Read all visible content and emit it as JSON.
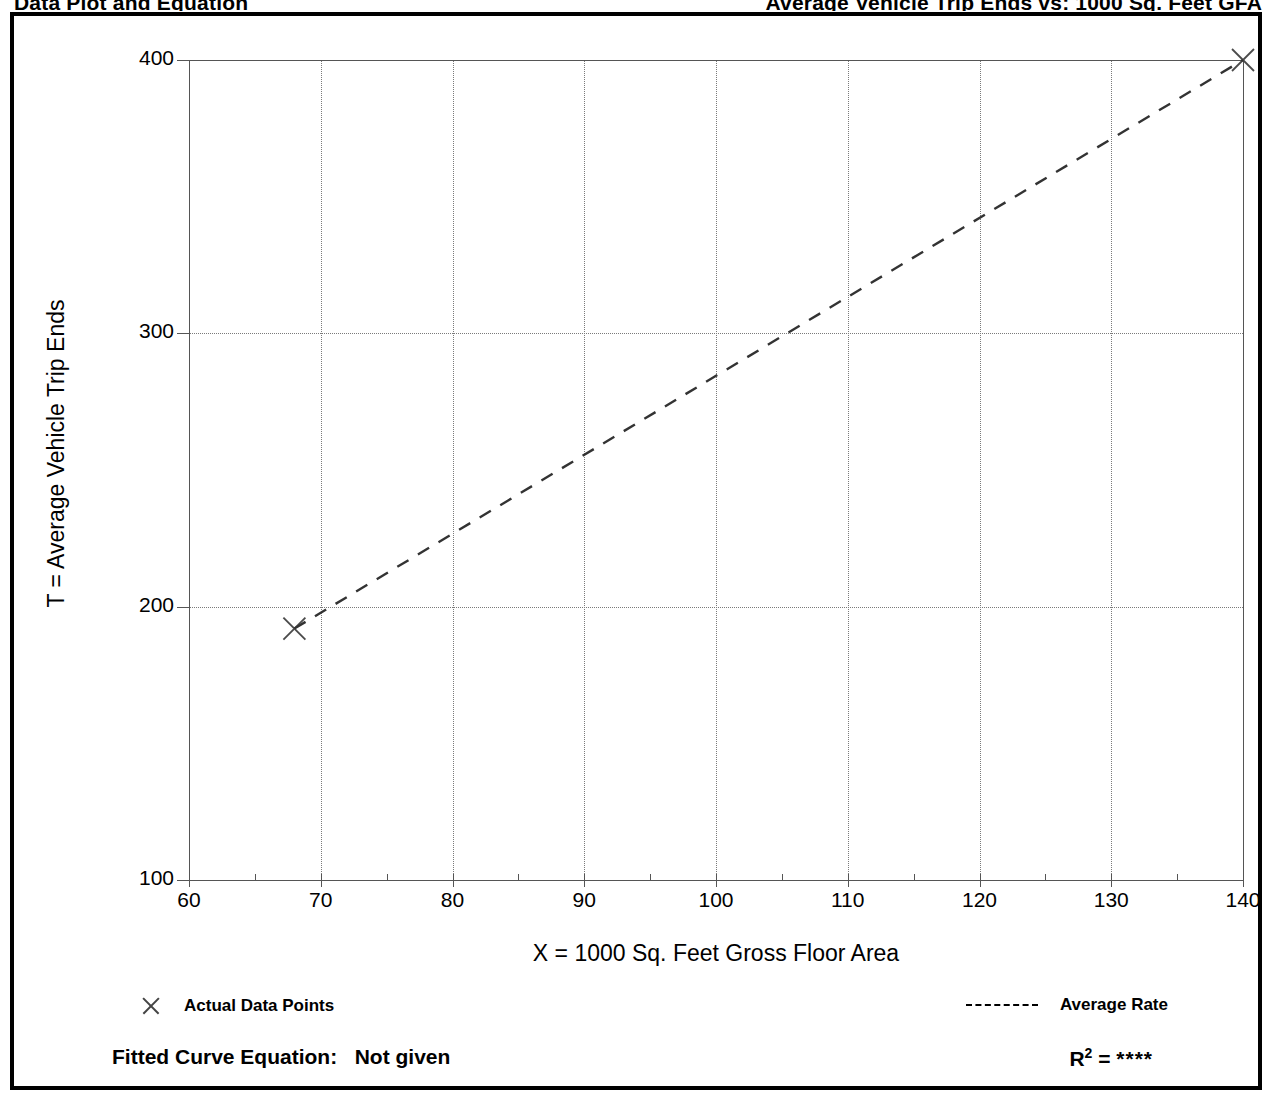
{
  "document": {
    "heading_left": "Data Plot and Equation",
    "heading_right": "Average Vehicle Trip Ends vs: 1000 Sq. Feet GFA"
  },
  "chart_data": {
    "type": "scatter",
    "title": "",
    "xlabel": "X = 1000 Sq. Feet Gross Floor Area",
    "ylabel": "T = Average Vehicle Trip Ends",
    "xlim": [
      60,
      140
    ],
    "ylim": [
      100,
      400
    ],
    "x_ticks": [
      60,
      70,
      80,
      90,
      100,
      110,
      120,
      130,
      140
    ],
    "y_ticks": [
      100,
      200,
      300,
      400
    ],
    "x_minor_step": 5,
    "grid": true,
    "grid_style": "dotted",
    "legend_position": "below-plot",
    "series": [
      {
        "name": "Actual Data Points",
        "type": "scatter",
        "marker": "x",
        "points": [
          {
            "x": 68,
            "y": 192
          },
          {
            "x": 140,
            "y": 400
          }
        ]
      },
      {
        "name": "Average Rate",
        "type": "line",
        "style": "dashed",
        "points": [
          {
            "x": 68,
            "y": 192
          },
          {
            "x": 140,
            "y": 400
          }
        ]
      }
    ],
    "annotations": {
      "fitted_curve_equation_label": "Fitted Curve Equation:",
      "fitted_curve_equation_value": "Not given",
      "r2_label": "R",
      "r2_exponent": "2",
      "r2_equals": "=",
      "r2_value": "****"
    }
  },
  "legend": {
    "left": {
      "marker_icon": "x-marker-icon",
      "label": "Actual Data Points"
    },
    "right": {
      "marker_icon": "dashed-line-icon",
      "label": "Average Rate"
    }
  },
  "colors": {
    "ink": "#000000",
    "axis": "#555555",
    "grid": "#7a7a7a",
    "series": "#333333",
    "background": "#ffffff"
  }
}
